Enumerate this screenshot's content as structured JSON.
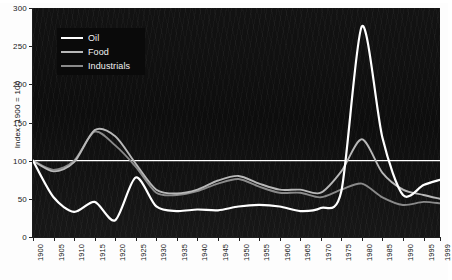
{
  "chart_data": {
    "type": "line",
    "title": "",
    "xlabel": "",
    "ylabel": "Index: 1900 = 100",
    "xlim": [
      1900,
      1999
    ],
    "ylim": [
      0,
      300
    ],
    "grid": false,
    "legend_position": "top-left",
    "background": "#111111",
    "reference_line": {
      "value": 100,
      "color": "#ffffff",
      "label": "100"
    },
    "yticks": [
      0,
      50,
      100,
      150,
      200,
      250,
      300
    ],
    "ytick_labels": [
      "0",
      "50",
      "100",
      "150",
      "200",
      "250",
      "300"
    ],
    "xticks": [
      1900,
      1905,
      1910,
      1915,
      1920,
      1925,
      1930,
      1935,
      1940,
      1945,
      1950,
      1955,
      1960,
      1965,
      1970,
      1975,
      1980,
      1985,
      1990,
      1995,
      1999
    ],
    "xtick_labels": [
      "1900",
      "1905",
      "1910",
      "1915",
      "1920",
      "1925",
      "1930",
      "1935",
      "1940",
      "1945",
      "1950",
      "1955",
      "1960",
      "1965",
      "1970",
      "1975",
      "1980",
      "1985",
      "1990",
      "1995",
      "1999"
    ],
    "x": [
      1900,
      1905,
      1910,
      1915,
      1920,
      1925,
      1930,
      1935,
      1940,
      1945,
      1950,
      1955,
      1960,
      1965,
      1970,
      1975,
      1980,
      1985,
      1990,
      1995,
      1999
    ],
    "series": [
      {
        "name": "Oil",
        "color": "#ffffff",
        "values": [
          100,
          52,
          33,
          46,
          22,
          78,
          40,
          34,
          36,
          35,
          40,
          42,
          40,
          34,
          38,
          60,
          276,
          130,
          55,
          68,
          75
        ]
      },
      {
        "name": "Food",
        "color": "#b8b8b8",
        "values": [
          100,
          86,
          98,
          140,
          132,
          96,
          62,
          57,
          62,
          74,
          80,
          70,
          62,
          62,
          58,
          86,
          128,
          84,
          62,
          55,
          50
        ]
      },
      {
        "name": "Industrials",
        "color": "#8a8a8a",
        "values": [
          100,
          88,
          100,
          138,
          120,
          92,
          58,
          55,
          60,
          70,
          76,
          66,
          58,
          58,
          52,
          62,
          70,
          52,
          42,
          46,
          44
        ]
      }
    ]
  },
  "legend": {
    "items": [
      {
        "label": "Oil",
        "color": "#ffffff"
      },
      {
        "label": "Food",
        "color": "#b8b8b8"
      },
      {
        "label": "Industrials",
        "color": "#8a8a8a"
      }
    ]
  },
  "axes": {
    "y_title": "Index: 1900 = 100"
  }
}
